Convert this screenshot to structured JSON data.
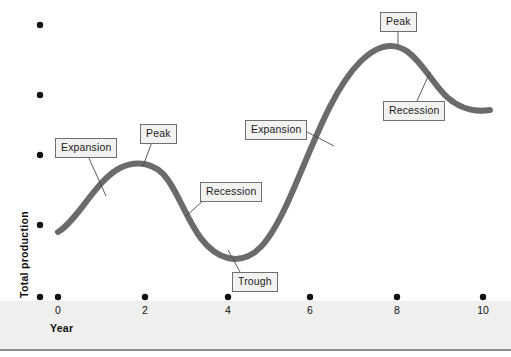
{
  "figure": {
    "kind": "business-cycle-diagram",
    "width": 511,
    "height": 357,
    "background_color": "#ffffff",
    "base_strip_color": "#efefee",
    "base_rule_color": "#8d8d8d"
  },
  "axes": {
    "x": {
      "title": "Year",
      "tick_labels": [
        "0",
        "2",
        "4",
        "6",
        "8",
        "10"
      ],
      "tick_values": [
        0,
        2,
        4,
        6,
        8,
        10
      ],
      "tick_x_px": [
        58,
        145,
        228,
        310,
        397,
        483
      ],
      "tick_y_px": 297,
      "origin_dot_x_px": 40,
      "marker_color": "#111111"
    },
    "y": {
      "title": "Total production",
      "tick_labels": [
        "",
        "",
        "",
        "",
        ""
      ],
      "tick_x_px": 40,
      "tick_y_px": [
        25,
        95,
        155,
        225,
        297
      ],
      "marker_color": "#111111"
    }
  },
  "curve": {
    "name": "business-cycle-curve",
    "color": "#6b6b6b",
    "stroke_width": 6,
    "path": "M 58 232 C 78 220 96 180 120 168 C 136 160 156 162 168 180 C 186 206 196 250 228 258 C 254 264 270 240 286 206 C 310 154 330 92 360 62 C 378 44 394 42 408 52 C 424 64 434 86 448 98 C 462 110 478 112 490 110",
    "key_points": [
      {
        "label": "start",
        "x": 58,
        "y": 232
      },
      {
        "label": "peak-1",
        "x": 145,
        "y": 164
      },
      {
        "label": "trough",
        "x": 228,
        "y": 258
      },
      {
        "label": "peak-2",
        "x": 397,
        "y": 46
      },
      {
        "label": "end",
        "x": 490,
        "y": 110
      }
    ]
  },
  "callouts": [
    {
      "id": "expansion-1",
      "text": "Expansion",
      "box": {
        "left": 55,
        "top": 138,
        "width": 62,
        "height": 17
      },
      "leader": {
        "x1": 88,
        "y1": 156,
        "x2": 106,
        "y2": 196
      }
    },
    {
      "id": "peak-1",
      "text": "Peak",
      "box": {
        "left": 140,
        "top": 124,
        "width": 36,
        "height": 17
      },
      "leader": {
        "x1": 152,
        "y1": 142,
        "x2": 143,
        "y2": 166
      }
    },
    {
      "id": "recession-1",
      "text": "Recession",
      "box": {
        "left": 200,
        "top": 182,
        "width": 61,
        "height": 17
      },
      "leader": {
        "x1": 204,
        "y1": 200,
        "x2": 186,
        "y2": 216
      }
    },
    {
      "id": "trough",
      "text": "Trough",
      "box": {
        "left": 232,
        "top": 272,
        "width": 47,
        "height": 17
      },
      "leader": {
        "x1": 240,
        "y1": 272,
        "x2": 228,
        "y2": 250
      }
    },
    {
      "id": "expansion-2",
      "text": "Expansion",
      "box": {
        "left": 245,
        "top": 120,
        "width": 62,
        "height": 17
      },
      "leader": {
        "x1": 307,
        "y1": 132,
        "x2": 334,
        "y2": 146
      }
    },
    {
      "id": "peak-2",
      "text": "Peak",
      "box": {
        "left": 380,
        "top": 12,
        "width": 36,
        "height": 17
      },
      "leader": {
        "x1": 398,
        "y1": 29,
        "x2": 398,
        "y2": 45
      }
    },
    {
      "id": "recession-2",
      "text": "Recession",
      "box": {
        "left": 383,
        "top": 101,
        "width": 61,
        "height": 17
      },
      "leader": {
        "x1": 417,
        "y1": 101,
        "x2": 430,
        "y2": 72
      }
    }
  ],
  "style": {
    "callout_fill": "#f2f2f1",
    "callout_border": "#6f6f6f",
    "leader_color": "#4a4a4a",
    "text_color": "#1b1b1b"
  }
}
